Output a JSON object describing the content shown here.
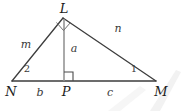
{
  "figure": {
    "kind": "geometry-diagram",
    "stroke_color": "#3d3d3d",
    "label_color": "#2b2b2b",
    "background_color": "#ffffff",
    "watermark_color": "#f1f1f1",
    "vertices": [
      {
        "id": "L",
        "label": "L",
        "x": 63,
        "y": 18,
        "label_x": 64,
        "label_y": 8
      },
      {
        "id": "N",
        "label": "N",
        "x": 12,
        "y": 81,
        "label_x": 11,
        "label_y": 91
      },
      {
        "id": "P",
        "label": "P",
        "x": 64,
        "y": 81,
        "label_x": 66,
        "label_y": 91
      },
      {
        "id": "M",
        "label": "M",
        "x": 156,
        "y": 81,
        "label_x": 161,
        "label_y": 91
      }
    ],
    "segments": [
      {
        "id": "NL",
        "from": "N",
        "to": "L"
      },
      {
        "id": "LM",
        "from": "L",
        "to": "M"
      },
      {
        "id": "NM",
        "from": "N",
        "to": "M"
      },
      {
        "id": "LP",
        "from": "L",
        "to": "P"
      }
    ],
    "side_labels": [
      {
        "id": "m",
        "text": "m",
        "segment": "NL",
        "x": 26,
        "y": 44
      },
      {
        "id": "n",
        "text": "n",
        "segment": "LM",
        "x": 118,
        "y": 28
      },
      {
        "id": "a",
        "text": "a",
        "segment": "LP",
        "x": 74,
        "y": 48
      },
      {
        "id": "b",
        "text": "b",
        "segment": "NP",
        "x": 40,
        "y": 92
      },
      {
        "id": "c",
        "text": "c",
        "segment": "PM",
        "x": 110,
        "y": 92
      }
    ],
    "angle_labels": [
      {
        "id": "angle-2",
        "text": "2",
        "at_vertex": "N",
        "x": 27,
        "y": 69
      },
      {
        "id": "angle-1",
        "text": "1",
        "at_vertex": "M",
        "x": 134,
        "y": 69
      }
    ],
    "right_angles": [
      {
        "id": "right-angle-L",
        "at_vertex": "L",
        "style": "diamond"
      },
      {
        "id": "right-angle-P",
        "at_vertex": "P",
        "style": "square"
      }
    ]
  }
}
